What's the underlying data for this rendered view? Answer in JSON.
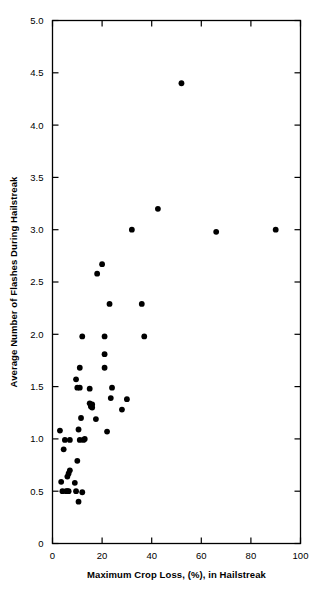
{
  "chart_data": {
    "type": "scatter",
    "title": "",
    "xlabel": "Maximum Crop Loss, (%), in Hailstreak",
    "ylabel": "Average Number of Flashes During Hailstreak",
    "xlim": [
      0,
      100
    ],
    "ylim": [
      0,
      5.0
    ],
    "xticks": [
      0,
      20,
      40,
      60,
      80,
      100
    ],
    "xtick_labels": [
      "0",
      "20",
      "40",
      "60",
      "80",
      "100"
    ],
    "yticks": [
      0,
      0.5,
      1.0,
      1.5,
      2.0,
      2.5,
      3.0,
      3.5,
      4.0,
      4.5,
      5.0
    ],
    "ytick_labels": [
      "0",
      "0.5",
      "1.0",
      "1.5",
      "2.0",
      "2.5",
      "3.0",
      "3.5",
      "4.0",
      "4.5",
      "5.0"
    ],
    "grid": false,
    "legend": null,
    "marker": {
      "shape": "circle",
      "color": "#000000",
      "size": 3.6
    },
    "frame_color": "#000000",
    "background_color": "#ffffff",
    "n_points": 52,
    "points": [
      [
        52.0,
        4.4
      ],
      [
        42.5,
        3.2
      ],
      [
        32.0,
        3.0
      ],
      [
        66.0,
        2.98
      ],
      [
        90.0,
        3.0
      ],
      [
        20.0,
        2.67
      ],
      [
        18.0,
        2.58
      ],
      [
        23.0,
        2.29
      ],
      [
        36.0,
        2.29
      ],
      [
        12.0,
        1.98
      ],
      [
        21.0,
        1.98
      ],
      [
        37.0,
        1.98
      ],
      [
        21.0,
        1.81
      ],
      [
        11.0,
        1.68
      ],
      [
        21.0,
        1.68
      ],
      [
        9.5,
        1.57
      ],
      [
        10.0,
        1.49
      ],
      [
        11.0,
        1.49
      ],
      [
        15.0,
        1.48
      ],
      [
        24.0,
        1.49
      ],
      [
        23.5,
        1.39
      ],
      [
        30.0,
        1.38
      ],
      [
        15.0,
        1.34
      ],
      [
        15.5,
        1.32
      ],
      [
        16.0,
        1.3
      ],
      [
        28.0,
        1.28
      ],
      [
        11.5,
        1.2
      ],
      [
        17.5,
        1.19
      ],
      [
        3.0,
        1.08
      ],
      [
        22.0,
        1.07
      ],
      [
        10.5,
        1.09
      ],
      [
        5.0,
        0.99
      ],
      [
        7.0,
        0.99
      ],
      [
        11.0,
        0.99
      ],
      [
        12.5,
        0.99
      ],
      [
        13.0,
        1.0
      ],
      [
        4.5,
        0.9
      ],
      [
        10.0,
        0.79
      ],
      [
        7.0,
        0.7
      ],
      [
        6.5,
        0.67
      ],
      [
        6.0,
        0.64
      ],
      [
        3.5,
        0.59
      ],
      [
        9.0,
        0.58
      ],
      [
        4.0,
        0.5
      ],
      [
        5.5,
        0.5
      ],
      [
        6.0,
        0.5
      ],
      [
        6.5,
        0.5
      ],
      [
        9.5,
        0.5
      ],
      [
        12.0,
        0.49
      ],
      [
        10.5,
        0.4
      ],
      [
        15.5,
        1.31
      ],
      [
        16.0,
        1.33
      ]
    ]
  }
}
